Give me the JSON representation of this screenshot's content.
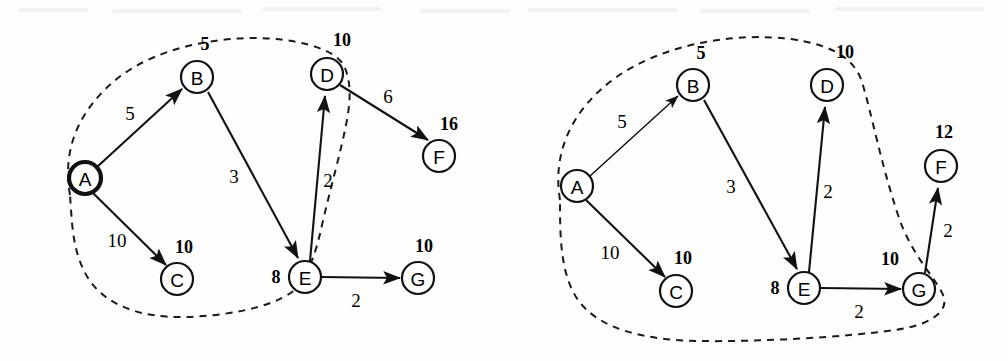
{
  "figure": {
    "background": "#fdfdfc",
    "ink_color": "#111111"
  },
  "panels": [
    {
      "id": "left-panel",
      "name": "stage-1",
      "boundary": {
        "name": "visited-set-boundary",
        "style": "dashed",
        "encloses": [
          "A",
          "B",
          "C",
          "D",
          "E"
        ],
        "path": "M 70 195 C 62 150 78 110 118 78 C 160 45 230 33 285 40 C 320 45 340 55 345 68 C 352 85 350 105 346 125 C 340 155 330 190 322 225 C 315 258 305 282 292 292 C 270 308 225 316 185 317 C 140 318 105 305 88 278 C 72 252 72 222 70 195 Z"
      },
      "nodes": [
        {
          "id": "A",
          "label": "A",
          "cx": 85,
          "cy": 178,
          "r": 16,
          "bold": true,
          "dist": null,
          "dist_x": null,
          "dist_y": null
        },
        {
          "id": "B",
          "label": "B",
          "cx": 197,
          "cy": 77,
          "r": 16,
          "bold": false,
          "dist": "5",
          "dist_x": 205,
          "dist_y": 44
        },
        {
          "id": "C",
          "label": "C",
          "cx": 177,
          "cy": 279,
          "r": 16,
          "bold": false,
          "dist": "10",
          "dist_x": 184,
          "dist_y": 247
        },
        {
          "id": "D",
          "label": "D",
          "cx": 327,
          "cy": 74,
          "r": 16,
          "bold": false,
          "dist": "10",
          "dist_x": 342,
          "dist_y": 40
        },
        {
          "id": "E",
          "label": "E",
          "cx": 305,
          "cy": 277,
          "r": 16,
          "bold": false,
          "dist": "8",
          "dist_x": 276,
          "dist_y": 277
        },
        {
          "id": "F",
          "label": "F",
          "cx": 439,
          "cy": 156,
          "r": 16,
          "bold": false,
          "dist": "16",
          "dist_x": 449,
          "dist_y": 124
        },
        {
          "id": "G",
          "label": "G",
          "cx": 418,
          "cy": 278,
          "r": 16,
          "bold": false,
          "dist": "10",
          "dist_x": 424,
          "dist_y": 246
        }
      ],
      "edges": [
        {
          "from": "A",
          "to": "B",
          "weight": "5",
          "wx": 130,
          "wy": 113,
          "thin": false
        },
        {
          "from": "A",
          "to": "C",
          "weight": "10",
          "wx": 117,
          "wy": 240,
          "thin": false
        },
        {
          "from": "B",
          "to": "E",
          "weight": "3",
          "wx": 234,
          "wy": 176,
          "thin": false
        },
        {
          "from": "E",
          "to": "D",
          "weight": "2",
          "wx": 328,
          "wy": 180,
          "thin": false
        },
        {
          "from": "D",
          "to": "F",
          "weight": "6",
          "wx": 388,
          "wy": 96,
          "thin": false
        },
        {
          "from": "E",
          "to": "G",
          "weight": "2",
          "wx": 356,
          "wy": 300,
          "thin": false
        }
      ]
    },
    {
      "id": "right-panel",
      "name": "stage-2",
      "boundary": {
        "name": "visited-set-boundary",
        "style": "dashed",
        "encloses": [
          "A",
          "B",
          "C",
          "D",
          "E",
          "G"
        ],
        "path": "M 560 200 C 552 152 572 108 618 76 C 665 44 735 32 790 39 C 835 45 855 60 862 82 C 872 115 880 160 898 215 C 912 258 940 282 944 298 C 948 314 925 326 895 330 C 845 337 760 342 700 341 C 645 340 600 330 578 300 C 560 274 560 235 560 200 Z"
      },
      "nodes": [
        {
          "id": "A",
          "label": "A",
          "cx": 577,
          "cy": 186,
          "r": 16,
          "bold": false,
          "dist": null,
          "dist_x": null,
          "dist_y": null
        },
        {
          "id": "B",
          "label": "B",
          "cx": 693,
          "cy": 85,
          "r": 16,
          "bold": false,
          "dist": "5",
          "dist_x": 701,
          "dist_y": 53
        },
        {
          "id": "C",
          "label": "C",
          "cx": 676,
          "cy": 291,
          "r": 16,
          "bold": false,
          "dist": "10",
          "dist_x": 683,
          "dist_y": 258
        },
        {
          "id": "D",
          "label": "D",
          "cx": 827,
          "cy": 85,
          "r": 16,
          "bold": false,
          "dist": "10",
          "dist_x": 845,
          "dist_y": 52
        },
        {
          "id": "E",
          "label": "E",
          "cx": 804,
          "cy": 288,
          "r": 16,
          "bold": false,
          "dist": "8",
          "dist_x": 775,
          "dist_y": 288
        },
        {
          "id": "F",
          "label": "F",
          "cx": 941,
          "cy": 166,
          "r": 16,
          "bold": false,
          "dist": "12",
          "dist_x": 944,
          "dist_y": 132
        },
        {
          "id": "G",
          "label": "G",
          "cx": 919,
          "cy": 289,
          "r": 16,
          "bold": false,
          "dist": "10",
          "dist_x": 890,
          "dist_y": 259
        }
      ],
      "edges": [
        {
          "from": "A",
          "to": "B",
          "weight": "5",
          "wx": 622,
          "wy": 121,
          "thin": true
        },
        {
          "from": "A",
          "to": "C",
          "weight": "10",
          "wx": 610,
          "wy": 252,
          "thin": false
        },
        {
          "from": "B",
          "to": "E",
          "weight": "3",
          "wx": 731,
          "wy": 186,
          "thin": false
        },
        {
          "from": "E",
          "to": "D",
          "weight": "2",
          "wx": 828,
          "wy": 191,
          "thin": false
        },
        {
          "from": "E",
          "to": "G",
          "weight": "2",
          "wx": 859,
          "wy": 311,
          "thin": false
        },
        {
          "from": "G",
          "to": "F",
          "weight": "2",
          "wx": 948,
          "wy": 230,
          "thin": false
        }
      ]
    }
  ],
  "graph_data": {
    "type": "directed-weighted-graph",
    "vertices": [
      "A",
      "B",
      "C",
      "D",
      "E",
      "F",
      "G"
    ],
    "edges": [
      {
        "from": "A",
        "to": "B",
        "weight": 5
      },
      {
        "from": "A",
        "to": "C",
        "weight": 10
      },
      {
        "from": "B",
        "to": "E",
        "weight": 3
      },
      {
        "from": "E",
        "to": "D",
        "weight": 2
      },
      {
        "from": "E",
        "to": "G",
        "weight": 2
      },
      {
        "from": "D",
        "to": "F",
        "weight": 6
      },
      {
        "from": "G",
        "to": "F",
        "weight": 2
      }
    ],
    "source": "A",
    "stages": [
      {
        "name": "stage-1",
        "visited": [
          "A",
          "B",
          "C",
          "D",
          "E"
        ],
        "distances": {
          "A": 0,
          "B": 5,
          "C": 10,
          "D": 10,
          "E": 8,
          "F": 16,
          "G": 10
        },
        "shown_edges": [
          "A-B",
          "A-C",
          "B-E",
          "E-D",
          "D-F",
          "E-G"
        ]
      },
      {
        "name": "stage-2",
        "visited": [
          "A",
          "B",
          "C",
          "D",
          "E",
          "G"
        ],
        "distances": {
          "A": 0,
          "B": 5,
          "C": 10,
          "D": 10,
          "E": 8,
          "F": 12,
          "G": 10
        },
        "shown_edges": [
          "A-B",
          "A-C",
          "B-E",
          "E-D",
          "E-G",
          "G-F"
        ]
      }
    ]
  }
}
